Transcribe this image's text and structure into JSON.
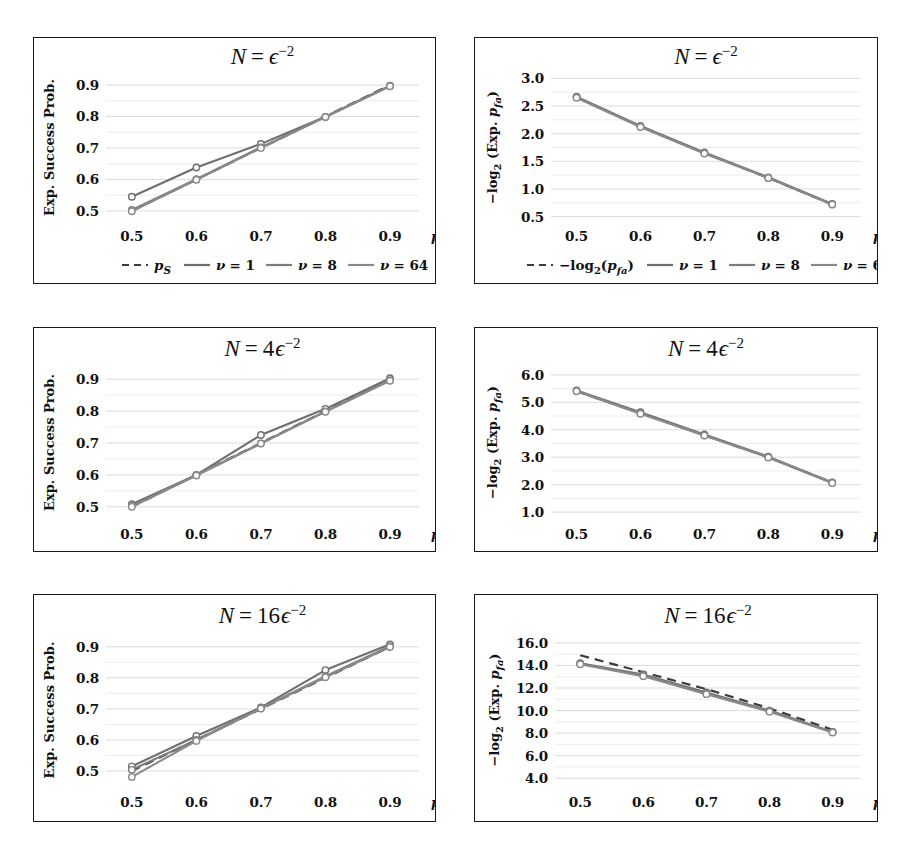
{
  "figure": {
    "background": "#ffffff",
    "line_color_nu1": "#6f6f6f",
    "line_color_nu8": "#7d7d7d",
    "line_color_nu64": "#8a8a8a",
    "reference_color": "#3c3c3c",
    "grid_color": "#d8d8d8",
    "axis_color": "#1a1a1a"
  },
  "legend_left": {
    "entries": [
      {
        "label": "p_S",
        "style": "dashed",
        "color": "#3c3c3c"
      },
      {
        "label": "ν = 1",
        "style": "solid",
        "color": "#6f6f6f"
      },
      {
        "label": "ν = 8",
        "style": "solid",
        "color": "#7d7d7d"
      },
      {
        "label": "ν = 64",
        "style": "solid",
        "color": "#8a8a8a"
      }
    ]
  },
  "legend_right": {
    "entries": [
      {
        "label": "−log₂(p_fa)",
        "style": "dashed",
        "color": "#3c3c3c"
      },
      {
        "label": "ν = 1",
        "style": "solid",
        "color": "#6f6f6f"
      },
      {
        "label": "ν = 8",
        "style": "solid",
        "color": "#7d7d7d"
      },
      {
        "label": "ν = 64",
        "style": "solid",
        "color": "#8a8a8a"
      }
    ]
  },
  "chart_data": [
    {
      "id": "success-eps2",
      "type": "line",
      "title": "N = ε⁻²",
      "title_plain": "N = eps^-2",
      "xlabel": "p_S",
      "ylabel": "Exp. Success Prob.",
      "x": [
        0.5,
        0.6,
        0.7,
        0.8,
        0.9
      ],
      "xticks": [
        "0.5",
        "0.6",
        "0.7",
        "0.8",
        "0.9"
      ],
      "yticks": [
        "0.5",
        "0.6",
        "0.7",
        "0.8",
        "0.9"
      ],
      "xlim": [
        0.46,
        0.945
      ],
      "ylim": [
        0.468,
        0.935
      ],
      "grid": true,
      "legend": "below-axis",
      "series": [
        {
          "name": "p_S",
          "style": "dashed",
          "values": [
            0.5,
            0.6,
            0.7,
            0.8,
            0.9
          ]
        },
        {
          "name": "ν = 1",
          "style": "solid",
          "values": [
            0.545,
            0.638,
            0.713,
            0.799,
            0.898
          ]
        },
        {
          "name": "ν = 8",
          "style": "solid",
          "values": [
            0.503,
            0.601,
            0.702,
            0.799,
            0.897
          ]
        },
        {
          "name": "ν = 64",
          "style": "solid",
          "values": [
            0.499,
            0.599,
            0.7,
            0.798,
            0.896
          ]
        }
      ]
    },
    {
      "id": "pfa-eps2",
      "type": "line",
      "title": "N = ε⁻²",
      "title_plain": "N = eps^-2",
      "xlabel": "p_S",
      "ylabel": "−log₂ (Exp. p_fa)",
      "x": [
        0.5,
        0.6,
        0.7,
        0.8,
        0.9
      ],
      "xticks": [
        "0.5",
        "0.6",
        "0.7",
        "0.8",
        "0.9"
      ],
      "yticks": [
        "0.5",
        "1.0",
        "1.5",
        "2.0",
        "2.5",
        "3.0"
      ],
      "xlim": [
        0.46,
        0.945
      ],
      "ylim": [
        0.42,
        3.08
      ],
      "grid": true,
      "legend": "below-axis",
      "series": [
        {
          "name": "−log₂(p_fa)",
          "style": "dashed",
          "values": [
            2.66,
            2.13,
            1.65,
            1.2,
            0.72
          ]
        },
        {
          "name": "ν = 1",
          "style": "solid",
          "values": [
            2.67,
            2.14,
            1.66,
            1.21,
            0.73
          ]
        },
        {
          "name": "ν = 8",
          "style": "solid",
          "values": [
            2.66,
            2.13,
            1.65,
            1.2,
            0.72
          ]
        },
        {
          "name": "ν = 64",
          "style": "solid",
          "values": [
            2.65,
            2.12,
            1.64,
            1.2,
            0.72
          ]
        }
      ]
    },
    {
      "id": "success-4eps2",
      "type": "line",
      "title": "N = 4ε⁻²",
      "title_plain": "N = 4 eps^-2",
      "xlabel": "p_S",
      "ylabel": "Exp. Success Prob.",
      "x": [
        0.5,
        0.6,
        0.7,
        0.8,
        0.9
      ],
      "xticks": [
        "0.5",
        "0.6",
        "0.7",
        "0.8",
        "0.9"
      ],
      "yticks": [
        "0.5",
        "0.6",
        "0.7",
        "0.8",
        "0.9"
      ],
      "xlim": [
        0.46,
        0.945
      ],
      "ylim": [
        0.468,
        0.935
      ],
      "grid": true,
      "legend": "none",
      "series": [
        {
          "name": "p_S",
          "style": "dashed",
          "values": [
            0.5,
            0.6,
            0.7,
            0.8,
            0.9
          ]
        },
        {
          "name": "ν = 1",
          "style": "solid",
          "values": [
            0.508,
            0.6,
            0.725,
            0.807,
            0.903
          ]
        },
        {
          "name": "ν = 8",
          "style": "solid",
          "values": [
            0.503,
            0.599,
            0.699,
            0.799,
            0.897
          ]
        },
        {
          "name": "ν = 64",
          "style": "solid",
          "values": [
            0.5,
            0.598,
            0.698,
            0.798,
            0.895
          ]
        }
      ]
    },
    {
      "id": "pfa-4eps2",
      "type": "line",
      "title": "N = 4ε⁻²",
      "title_plain": "N = 4 eps^-2",
      "xlabel": "p_S",
      "ylabel": "−log₂ (Exp. p_fa)",
      "x": [
        0.5,
        0.6,
        0.7,
        0.8,
        0.9
      ],
      "xticks": [
        "0.5",
        "0.6",
        "0.7",
        "0.8",
        "0.9"
      ],
      "yticks": [
        "1.0",
        "2.0",
        "3.0",
        "4.0",
        "5.0",
        "6.0"
      ],
      "xlim": [
        0.46,
        0.945
      ],
      "ylim": [
        0.82,
        6.25
      ],
      "grid": true,
      "legend": "none",
      "series": [
        {
          "name": "−log₂(p_fa)",
          "style": "dashed",
          "values": [
            5.4,
            4.6,
            3.8,
            3.0,
            2.07
          ]
        },
        {
          "name": "ν = 1",
          "style": "solid",
          "values": [
            5.43,
            4.64,
            3.83,
            3.02,
            2.08
          ]
        },
        {
          "name": "ν = 8",
          "style": "solid",
          "values": [
            5.41,
            4.6,
            3.8,
            3.0,
            2.07
          ]
        },
        {
          "name": "ν = 64",
          "style": "solid",
          "values": [
            5.4,
            4.58,
            3.79,
            2.99,
            2.06
          ]
        }
      ]
    },
    {
      "id": "success-16eps2",
      "type": "line",
      "title": "N = 16ε⁻²",
      "title_plain": "N = 16 eps^-2",
      "xlabel": "p_S",
      "ylabel": "Exp. Success Prob.",
      "x": [
        0.5,
        0.6,
        0.7,
        0.8,
        0.9
      ],
      "xticks": [
        "0.5",
        "0.6",
        "0.7",
        "0.8",
        "0.9"
      ],
      "yticks": [
        "0.5",
        "0.6",
        "0.7",
        "0.8",
        "0.9"
      ],
      "xlim": [
        0.46,
        0.945
      ],
      "ylim": [
        0.455,
        0.938
      ],
      "grid": true,
      "legend": "none",
      "series": [
        {
          "name": "p_S",
          "style": "dashed",
          "values": [
            0.5,
            0.6,
            0.7,
            0.8,
            0.9
          ]
        },
        {
          "name": "ν = 1",
          "style": "solid",
          "values": [
            0.515,
            0.613,
            0.705,
            0.825,
            0.908
          ]
        },
        {
          "name": "ν = 8",
          "style": "solid",
          "values": [
            0.504,
            0.6,
            0.702,
            0.805,
            0.902
          ]
        },
        {
          "name": "ν = 64",
          "style": "solid",
          "values": [
            0.481,
            0.597,
            0.701,
            0.802,
            0.899
          ]
        }
      ]
    },
    {
      "id": "pfa-16eps2",
      "type": "line",
      "title": "N = 16ε⁻²",
      "title_plain": "N = 16 eps^-2",
      "xlabel": "p_S",
      "ylabel": "−log₂ (Exp. p_fa)",
      "x": [
        0.5,
        0.6,
        0.7,
        0.8,
        0.9
      ],
      "xticks": [
        "0.5",
        "0.6",
        "0.7",
        "0.8",
        "0.9"
      ],
      "yticks": [
        "4.0",
        "6.0",
        "8.0",
        "10.0",
        "12.0",
        "14.0",
        "16.0"
      ],
      "xlim": [
        0.46,
        0.945
      ],
      "ylim": [
        3.4,
        16.7
      ],
      "grid": true,
      "legend": "none",
      "series": [
        {
          "name": "−log₂(p_fa)",
          "style": "dashed",
          "values": [
            14.9,
            13.4,
            11.9,
            10.2,
            8.3
          ]
        },
        {
          "name": "ν = 1",
          "style": "solid",
          "values": [
            14.2,
            13.2,
            11.6,
            10.0,
            8.1
          ]
        },
        {
          "name": "ν = 8",
          "style": "solid",
          "values": [
            14.15,
            13.1,
            11.5,
            9.95,
            8.08
          ]
        },
        {
          "name": "ν = 64",
          "style": "solid",
          "values": [
            14.1,
            13.05,
            11.45,
            9.9,
            8.05
          ]
        }
      ]
    }
  ]
}
